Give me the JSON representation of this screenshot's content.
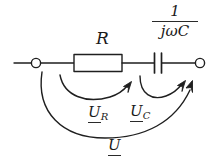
{
  "diagram": {
    "background_color": "#ffffff",
    "ink_color": "#1a1a1a",
    "labels": {
      "resistor": "R",
      "capacitor_numerator": "1",
      "capacitor_denominator": "jωC",
      "voltage_resistor": "U",
      "voltage_resistor_sub": "R",
      "voltage_capacitor": "U",
      "voltage_capacitor_sub": "C",
      "voltage_total": "U"
    },
    "components": [
      {
        "name": "left-terminal",
        "type": "open-terminal"
      },
      {
        "name": "resistor",
        "type": "rectangle-resistor"
      },
      {
        "name": "capacitor",
        "type": "parallel-plate-capacitor"
      },
      {
        "name": "right-terminal",
        "type": "open-terminal"
      }
    ],
    "arcs": [
      {
        "name": "voltage-arc-ur",
        "from": "left-terminal",
        "to": "resistor-right-node"
      },
      {
        "name": "voltage-arc-uc",
        "from": "resistor-right-node",
        "to": "right-terminal"
      },
      {
        "name": "voltage-arc-u",
        "from": "left-terminal",
        "to": "right-terminal"
      }
    ]
  }
}
